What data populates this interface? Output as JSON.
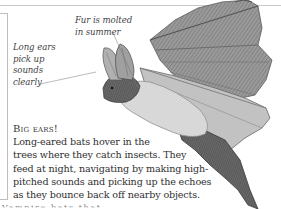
{
  "annotations": {
    "fur": [
      "Fur is molted",
      "in summer"
    ],
    "ears": [
      "Long ears",
      "pick up",
      "sounds",
      "clearly"
    ]
  },
  "caption": {
    "heading": "Big ears!",
    "lines": [
      "Long-eared bats hover in the",
      "trees where they catch insects. They",
      "feed at night, navigating by making high-",
      "pitched sounds and picking up the echoes",
      "as they bounce back off nearby objects."
    ]
  },
  "cutoff_text": "Vampire bats that ...",
  "illustration": {
    "subject": "long-eared bat in flight",
    "colors": {
      "wing": "#8f8f8f",
      "wing_light": "#bdbdbd",
      "body": "#d8d8d8",
      "dark": "#4a4a4a",
      "rule": "#c9c9c9"
    }
  }
}
